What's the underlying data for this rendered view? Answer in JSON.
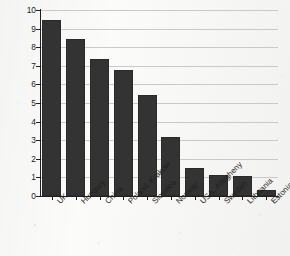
{
  "chart_data": {
    "type": "bar",
    "title": "",
    "xlabel": "",
    "ylabel": "Increase in incidence (% per year)",
    "categories": [
      "UK",
      "Hungary",
      "China",
      "Poland, Krakow",
      "Slovakia",
      "Norway",
      "USA, Allegheny",
      "Sweden",
      "Lithuania",
      "Estonia"
    ],
    "values": [
      9.45,
      8.45,
      7.35,
      6.8,
      5.45,
      3.15,
      1.5,
      1.15,
      1.05,
      0.3
    ],
    "ylim": [
      0,
      10
    ],
    "ytick_labels": [
      "0",
      "1",
      "2",
      "3",
      "4",
      "5",
      "6",
      "7",
      "8",
      "9",
      "10"
    ],
    "ytick_values": [
      0,
      1,
      2,
      3,
      4,
      5,
      6,
      7,
      8,
      9,
      10
    ],
    "grid": true,
    "grid_axis": "y",
    "legend": false,
    "bar_color": "#333333",
    "grid_color": "#c9c9c9",
    "axis_color": "#1f1f1f",
    "background_color": "#f5f5f3"
  }
}
